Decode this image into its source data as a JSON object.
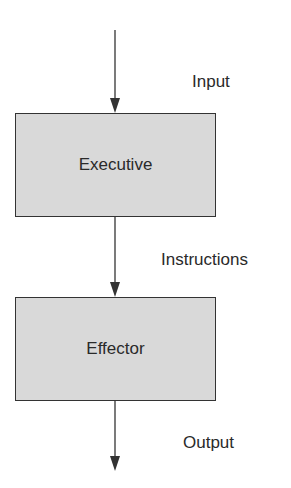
{
  "diagram": {
    "nodes": [
      {
        "id": "executive",
        "label": "Executive"
      },
      {
        "id": "effector",
        "label": "Effector"
      }
    ],
    "edges": [
      {
        "from": "",
        "to": "executive",
        "label": "Input"
      },
      {
        "from": "executive",
        "to": "effector",
        "label": "Instructions"
      },
      {
        "from": "effector",
        "to": "",
        "label": "Output"
      }
    ],
    "colors": {
      "box_fill": "#d9d9d9",
      "stroke": "#333333"
    }
  }
}
